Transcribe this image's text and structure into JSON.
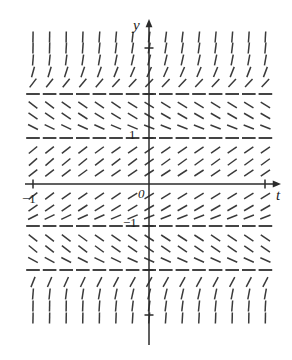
{
  "figure": {
    "kind": "slope-field",
    "background": "#ffffff",
    "stroke_color": "#3a3a3a",
    "axis_color": "#2b2b2b",
    "width": 292,
    "height": 360
  },
  "axes": {
    "y_axis_label": "y",
    "t_axis_label": "t",
    "origin_label": "0",
    "x_tick_label_neg1": "−1",
    "y_tick_label_pos1": "1",
    "y_tick_label_neg1": "−1",
    "x_axis_pixel_y": 184,
    "y_axis_pixel_x": 149,
    "x_axis_from": 25,
    "x_axis_to": 278,
    "y_axis_from": 22,
    "y_axis_to": 345,
    "y_ticks_pixel": [
      48,
      94,
      138,
      226,
      270,
      315
    ],
    "x_ticks_pixel": [
      33,
      265
    ]
  },
  "chart_data": {
    "type": "scatter",
    "title": "",
    "xlabel": "t",
    "ylabel": "y",
    "grid": false,
    "legend": null,
    "xlim": [
      -3.5,
      3.0
    ],
    "ylim": [
      -3.1,
      3.1
    ],
    "equilibria": [
      2,
      1,
      -1,
      -2
    ],
    "columns": 15,
    "rows": 17,
    "x_pixel_start": 33,
    "x_pixel_step": 16.6,
    "row_pixel_y": [
      48,
      60,
      72,
      83,
      94,
      105,
      116,
      127,
      138,
      150,
      162,
      174,
      196,
      208,
      216,
      226,
      238,
      249,
      260,
      270,
      282,
      294,
      306,
      318
    ],
    "segment_length": 11,
    "rows_detail": [
      {
        "y_pixel": 37,
        "slope_deg": -82,
        "note": "steep positive (near vertical)"
      },
      {
        "y_pixel": 48,
        "slope_deg": -80,
        "note": "steep positive"
      },
      {
        "y_pixel": 60,
        "slope_deg": -76,
        "note": "steep positive"
      },
      {
        "y_pixel": 72,
        "slope_deg": -66,
        "note": "positive"
      },
      {
        "y_pixel": 83,
        "slope_deg": -46,
        "note": "positive, shallowing"
      },
      {
        "y_pixel": 94,
        "slope_deg": 0,
        "note": "equilibrium y = 2"
      },
      {
        "y_pixel": 105,
        "slope_deg": 32,
        "note": "negative"
      },
      {
        "y_pixel": 116,
        "slope_deg": 30,
        "note": "negative"
      },
      {
        "y_pixel": 127,
        "slope_deg": 22,
        "note": "negative, shallowing"
      },
      {
        "y_pixel": 138,
        "slope_deg": 0,
        "note": "equilibrium y = 1"
      },
      {
        "y_pixel": 150,
        "slope_deg": -34,
        "note": "positive"
      },
      {
        "y_pixel": 162,
        "slope_deg": -36,
        "note": "positive"
      },
      {
        "y_pixel": 173,
        "slope_deg": -33,
        "note": "positive"
      },
      {
        "y_pixel": 196,
        "slope_deg": -32,
        "note": "positive"
      },
      {
        "y_pixel": 208,
        "slope_deg": -30,
        "note": "positive"
      },
      {
        "y_pixel": 217,
        "slope_deg": -22,
        "note": "positive, shallowing"
      },
      {
        "y_pixel": 226,
        "slope_deg": 0,
        "note": "equilibrium y = -1"
      },
      {
        "y_pixel": 238,
        "slope_deg": 33,
        "note": "negative"
      },
      {
        "y_pixel": 249,
        "slope_deg": 34,
        "note": "negative"
      },
      {
        "y_pixel": 260,
        "slope_deg": 24,
        "note": "negative, shallowing"
      },
      {
        "y_pixel": 270,
        "slope_deg": 0,
        "note": "equilibrium y = -2"
      },
      {
        "y_pixel": 282,
        "slope_deg": -60,
        "note": "positive, steepening"
      },
      {
        "y_pixel": 294,
        "slope_deg": -76,
        "note": "steep positive"
      },
      {
        "y_pixel": 306,
        "slope_deg": -82,
        "note": "near vertical"
      },
      {
        "y_pixel": 318,
        "slope_deg": -85,
        "note": "near vertical"
      }
    ]
  }
}
